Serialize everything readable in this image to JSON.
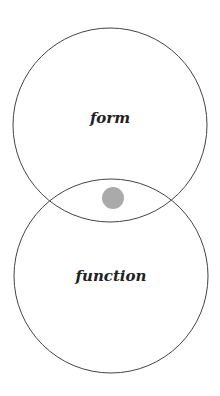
{
  "diagram": {
    "type": "venn",
    "circles": [
      {
        "label": "form",
        "cx": 110,
        "cy": 125,
        "r": 97
      },
      {
        "label": "function",
        "cx": 111,
        "cy": 276,
        "r": 97
      }
    ],
    "intersection_dot": {
      "cx": 113,
      "cy": 198,
      "r": 11,
      "color": "#aaaaaa"
    },
    "stroke_color": "#444444"
  }
}
